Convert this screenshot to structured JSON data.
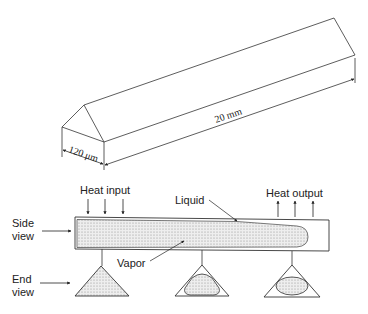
{
  "prism": {
    "width_label": "120 μm",
    "length_label": "20 mm"
  },
  "side_view": {
    "label_line1": "Side",
    "label_line2": "view",
    "heat_input_label": "Heat input",
    "heat_output_label": "Heat output",
    "liquid_label": "Liquid",
    "vapor_label": "Vapor"
  },
  "end_view": {
    "label_line1": "End",
    "label_line2": "view"
  },
  "colors": {
    "stroke": "#333333",
    "vapor_fill": "#e6e6e6",
    "dot": "#9a9a9a"
  }
}
